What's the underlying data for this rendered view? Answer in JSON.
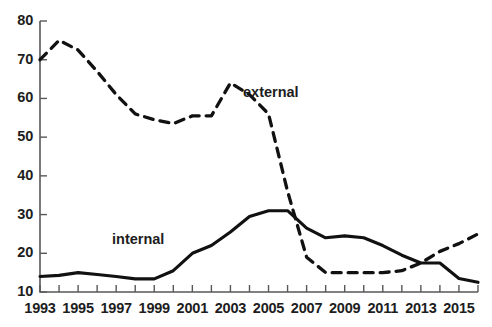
{
  "chart_data": {
    "type": "line",
    "title": "",
    "subtitle": "",
    "xlabel": "",
    "ylabel": "",
    "xlim": [
      1993,
      2016
    ],
    "ylim": [
      10,
      80
    ],
    "ytick_labels": [
      "80",
      "70",
      "60",
      "50",
      "40",
      "30",
      "20",
      "10"
    ],
    "ytick_values": [
      80,
      70,
      60,
      50,
      40,
      30,
      20,
      10
    ],
    "xtick_labels": [
      "1993",
      "1995",
      "1997",
      "1999",
      "2001",
      "2003",
      "2005",
      "2007",
      "2009",
      "2011",
      "2013",
      "2015"
    ],
    "xtick_values": [
      1993,
      1995,
      1997,
      1999,
      2001,
      2003,
      2005,
      2007,
      2009,
      2011,
      2013,
      2015
    ],
    "minor_xticks": [
      1993,
      1994,
      1995,
      1996,
      1997,
      1998,
      1999,
      2000,
      2001,
      2002,
      2003,
      2004,
      2005,
      2006,
      2007,
      2008,
      2009,
      2010,
      2011,
      2012,
      2013,
      2014,
      2015,
      2016
    ],
    "grid": false,
    "legend_position": "inline-annotation",
    "x": [
      1993,
      1994,
      1995,
      1996,
      1997,
      1998,
      1999,
      2000,
      2001,
      2002,
      2003,
      2004,
      2005,
      2006,
      2007,
      2008,
      2009,
      2010,
      2011,
      2012,
      2013,
      2014,
      2015,
      2016
    ],
    "series": [
      {
        "name": "external",
        "style": "dashed",
        "color": "#111111",
        "label": "external",
        "values": [
          70,
          75,
          72.5,
          67,
          61,
          56,
          54.5,
          53.5,
          55.5,
          55.5,
          64,
          61,
          56,
          36,
          19,
          15,
          15,
          15,
          15,
          15.5,
          17.5,
          20.5,
          22.5,
          25
        ]
      },
      {
        "name": "internal",
        "style": "solid",
        "color": "#111111",
        "label": "internal",
        "values": [
          14,
          14.3,
          15,
          14.5,
          14,
          13.4,
          13.4,
          15.5,
          20,
          22,
          25.5,
          29.5,
          31,
          31,
          26.5,
          24,
          24.5,
          24,
          22,
          19.5,
          17.5,
          17.5,
          13.5,
          12.5
        ]
      }
    ]
  },
  "annotations": {
    "external_label": "external",
    "internal_label": "internal"
  }
}
